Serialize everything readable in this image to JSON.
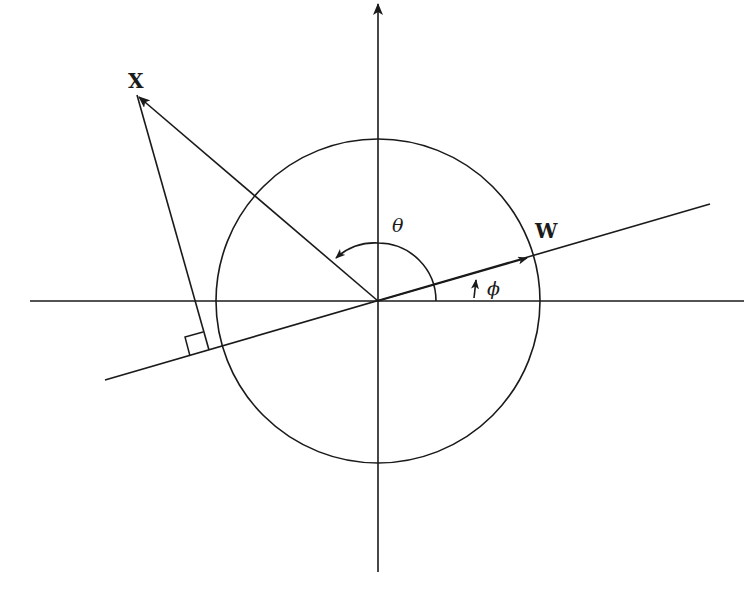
{
  "diagram": {
    "title": "",
    "labels": {
      "vector_x": "X",
      "vector_w": "W",
      "angle_theta": "θ",
      "angle_phi": "ϕ"
    },
    "elements": {
      "horizontal_axis": "x-axis with arrow to the right",
      "vertical_axis": "y-axis with arrow upward",
      "unit_circle": "circle centered at origin",
      "weight_line": "line through origin along W direction",
      "vector_x": "arrow from origin to point X",
      "perpendicular": "projection of X onto W line with right-angle marker",
      "theta_arc": "arc from positive x-axis to X vector",
      "phi_arrow": "small arrow indicating angle of W from x-axis"
    },
    "colors": {
      "stroke": "#1a1a1a",
      "background": "#ffffff"
    }
  }
}
